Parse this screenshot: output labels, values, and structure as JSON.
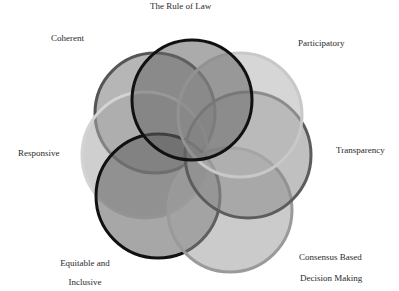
{
  "diagram": {
    "type": "seven-circle overlapping venn (good governance principles)",
    "labels": {
      "rule_of_law": "The Rule of Law",
      "coherent": "Coherent",
      "participatory": "Participatory",
      "responsive": "Responsive",
      "transparency": "Transparency",
      "equitable_line1": "Equitable and",
      "equitable_line2": "Inclusive",
      "consensus_line1": "Consensus Based",
      "consensus_line2": "Decision Making"
    },
    "circles": [
      {
        "name": "Coherent",
        "cx": 155,
        "cy": 113,
        "r": 60,
        "fill": "#7a7a7a",
        "stroke": "#555555"
      },
      {
        "name": "Responsive",
        "cx": 145,
        "cy": 155,
        "r": 63,
        "fill": "#a8a8a8",
        "stroke": "#d4d4d4"
      },
      {
        "name": "Equitable and Inclusive",
        "cx": 158,
        "cy": 196,
        "r": 62,
        "fill": "#5e5e5e",
        "stroke": "#111111"
      },
      {
        "name": "Consensus Based Decision Making",
        "cx": 230,
        "cy": 210,
        "r": 62,
        "fill": "#a0a0a0",
        "stroke": "#9a9a9a"
      },
      {
        "name": "Transparency",
        "cx": 248,
        "cy": 155,
        "r": 63,
        "fill": "#8c8c8c",
        "stroke": "#5c5c5c"
      },
      {
        "name": "Participatory",
        "cx": 240,
        "cy": 115,
        "r": 62,
        "fill": "#b4b4b4",
        "stroke": "#c8c8c8"
      },
      {
        "name": "The Rule of Law",
        "cx": 192,
        "cy": 100,
        "r": 60,
        "fill": "#666666",
        "stroke": "#111111"
      }
    ],
    "colors": {
      "background": "#ffffff",
      "text": "#2a2a2a"
    }
  }
}
